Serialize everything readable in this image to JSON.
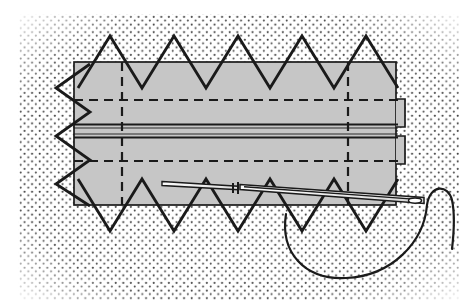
{
  "figure": {
    "type": "technical-illustration",
    "domain": "sewing",
    "caption_partial": "",
    "canvas": {
      "width": 475,
      "height": 308
    },
    "colors": {
      "background": "#ffffff",
      "stipple_dot": "#4a4a4a",
      "fabric_fill": "#c6c6c6",
      "outline": "#1a1a1a",
      "dashed_line": "#1a1a1a",
      "needle_body": "#e9e9e9",
      "thread": "#1a1a1a"
    },
    "background_panel": {
      "name": "stippled-ground",
      "label": "stippled background fabric",
      "x": 18,
      "y": 14,
      "width": 441,
      "height": 286,
      "dot_radius": 1.05,
      "dot_spacing": 7.6,
      "density": "medium"
    },
    "fabric_panel": {
      "name": "gray-fabric-rectangle",
      "label": "folded fabric strip",
      "x": 74,
      "y": 62,
      "width": 322,
      "height": 143,
      "fill": "#c6c6c6",
      "stroke": "#1a1a1a",
      "stroke_width": 1.6
    },
    "fold_lines_horizontal": [
      {
        "name": "upper-fold-dashed",
        "y": 100,
        "x1": 74,
        "x2": 404,
        "style": "dashed"
      },
      {
        "name": "lower-fold-dashed",
        "y": 161,
        "x1": 74,
        "x2": 404,
        "style": "dashed"
      }
    ],
    "fold_lines_vertical": [
      {
        "name": "left-fold-dashed",
        "x": 122,
        "y1": 62,
        "y2": 205,
        "style": "dashed"
      },
      {
        "name": "right-fold-dashed",
        "x": 348,
        "y1": 62,
        "y2": 205,
        "style": "dashed"
      }
    ],
    "seam_lines": [
      {
        "name": "seam-upper-solid",
        "y": 125,
        "x1": 74,
        "x2": 396,
        "style": "solid"
      },
      {
        "name": "seam-lower-solid",
        "y": 137,
        "x1": 74,
        "x2": 396,
        "style": "solid"
      }
    ],
    "right_edge_folds": [
      {
        "name": "right-fold-tab-upper",
        "x": 396,
        "y": 100,
        "width": 9,
        "height": 26
      },
      {
        "name": "right-fold-tab-lower",
        "x": 396,
        "y": 137,
        "width": 9,
        "height": 26
      }
    ],
    "stitching": {
      "name": "cross-stitch-herringbone",
      "label": "herringbone / cross stitch",
      "stroke": "#1a1a1a",
      "stroke_width": 2.6,
      "top_edge": {
        "count": 5,
        "amplitude": 26,
        "start_x": 78,
        "step": 64,
        "edge_y": 62
      },
      "bottom_edge": {
        "count": 5,
        "amplitude": 26,
        "start_x": 78,
        "step": 64,
        "edge_y": 205
      },
      "left_edge": {
        "count": 3,
        "amplitude": 24,
        "start_y": 76,
        "step": 46,
        "edge_x": 74
      }
    },
    "needle": {
      "name": "sewing-needle",
      "label": "threaded sewing needle",
      "tip": {
        "x": 238,
        "y": 186
      },
      "eye": {
        "x": 422,
        "y": 200
      },
      "length": 186,
      "fill": "#ededed",
      "stroke": "#1a1a1a"
    },
    "thread": {
      "name": "thread-loop",
      "label": "thread forming a loop through fabric",
      "stroke": "#1a1a1a",
      "stroke_width": 2.2,
      "loop_start": {
        "x": 286,
        "y": 214
      },
      "loop_bottom": {
        "x": 348,
        "y": 276
      },
      "needle_eye": {
        "x": 424,
        "y": 199
      },
      "tail_end": {
        "x": 455,
        "y": 248
      }
    }
  }
}
